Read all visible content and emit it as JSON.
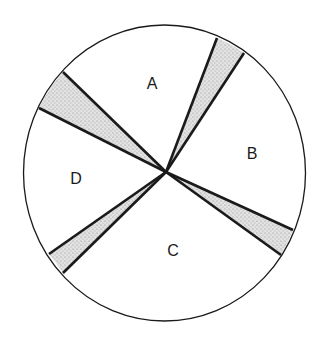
{
  "diagram": {
    "type": "pie-division",
    "circle": {
      "cx": 164.5,
      "cy": 173,
      "rx": 141,
      "ry": 148
    },
    "center": {
      "x": 166,
      "y": 172
    },
    "stroke_color": "#1a1a1a",
    "shade_color": "#c9c9c9",
    "sectors": [
      {
        "label": "A",
        "x": 152,
        "y": 89
      },
      {
        "label": "B",
        "x": 252,
        "y": 159
      },
      {
        "label": "C",
        "x": 173,
        "y": 256
      },
      {
        "label": "D",
        "x": 76,
        "y": 184
      }
    ],
    "shaded_wedges": [
      {
        "name": "wedge-top-left",
        "p1": [
          63,
          72
        ],
        "p2": [
          39,
          108
        ]
      },
      {
        "name": "wedge-top-right",
        "p1": [
          217,
          38
        ],
        "p2": [
          244,
          53
        ]
      },
      {
        "name": "wedge-right",
        "p1": [
          293,
          230
        ],
        "p2": [
          281,
          255
        ]
      },
      {
        "name": "wedge-bottom-left",
        "p1": [
          49,
          254
        ],
        "p2": [
          63,
          273
        ]
      }
    ]
  }
}
